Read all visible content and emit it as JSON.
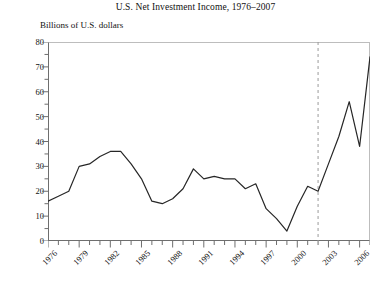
{
  "chart_data": {
    "type": "line",
    "title": "U.S. Net Investment Income, 1976–2007",
    "subtitle": "Billions of U.S. dollars",
    "ylabel": "Billions of U.S. dollars",
    "xlabel": "",
    "ylim": [
      0,
      80
    ],
    "ytick_step": 10,
    "yminor_step": 5,
    "xlim": [
      1976,
      2007
    ],
    "grid": false,
    "legend": false,
    "line_color": "#262626",
    "frame_color": "#6e6e6e",
    "yticks": [
      0,
      10,
      20,
      30,
      40,
      50,
      60,
      70,
      80
    ],
    "ytick_labels": [
      "0",
      "10",
      "20",
      "30",
      "40",
      "50",
      "60",
      "70",
      "80"
    ],
    "xticks": [
      1976,
      1979,
      1982,
      1985,
      1988,
      1991,
      1994,
      1997,
      2000,
      2003,
      2006
    ],
    "xtick_labels": [
      "1976",
      "1979",
      "1982",
      "1985",
      "1988",
      "1991",
      "1994",
      "1997",
      "2000",
      "2003",
      "2006"
    ],
    "xtick_rotation": -45,
    "annotations": [
      {
        "name": "reference-line",
        "type": "vline",
        "x": 2002,
        "style": "dashed",
        "color": "#9a9a9a"
      }
    ],
    "x": [
      1976,
      1977,
      1978,
      1979,
      1980,
      1981,
      1982,
      1983,
      1984,
      1985,
      1986,
      1987,
      1988,
      1989,
      1990,
      1991,
      1992,
      1993,
      1994,
      1995,
      1996,
      1997,
      1998,
      1999,
      2000,
      2001,
      2002,
      2003,
      2004,
      2005,
      2006,
      2007
    ],
    "values": [
      16,
      18,
      20,
      30,
      31,
      34,
      36,
      36,
      31,
      25,
      16,
      15,
      17,
      21,
      29,
      25,
      26,
      25,
      25,
      21,
      23,
      13,
      9,
      4,
      14,
      22,
      20,
      31,
      42,
      56,
      38,
      74
    ],
    "series": [
      {
        "name": "U.S. Net Investment Income",
        "values": [
          16,
          18,
          20,
          30,
          31,
          34,
          36,
          36,
          31,
          25,
          16,
          15,
          17,
          21,
          29,
          25,
          26,
          25,
          25,
          21,
          23,
          13,
          9,
          4,
          14,
          22,
          20,
          31,
          42,
          56,
          38,
          74
        ]
      }
    ]
  }
}
